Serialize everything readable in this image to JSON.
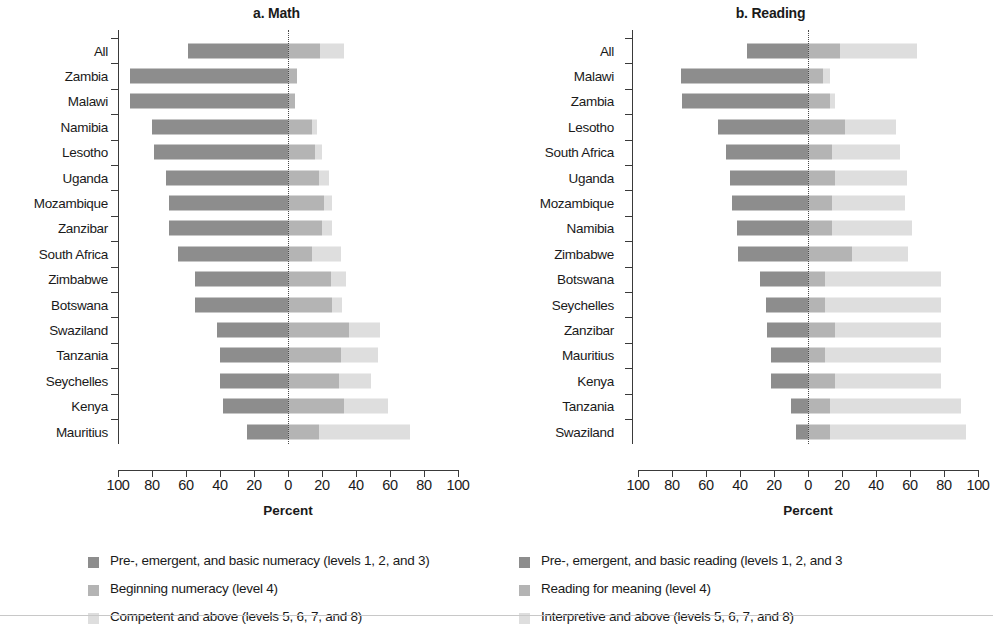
{
  "figure": {
    "background": "#ffffff",
    "colors": {
      "level123": "#8d8d8d",
      "level4": "#b4b4b4",
      "level5678": "#dedede",
      "axis": "#3a3a3a",
      "zeroline": "#4a4a4a"
    },
    "axis_title": "Percent",
    "tick_labels": [
      "100",
      "80",
      "60",
      "40",
      "20",
      "0",
      "20",
      "40",
      "60",
      "80",
      "100"
    ],
    "tick_values": [
      -100,
      -80,
      -60,
      -40,
      -20,
      0,
      20,
      40,
      60,
      80,
      100
    ]
  },
  "panels": [
    {
      "id": "math",
      "title": "a. Math",
      "axis_title": "Percent",
      "legend": [
        {
          "label": "Pre-, emergent, and basic numeracy (levels 1, 2, and 3)",
          "color_key": "level123"
        },
        {
          "label": "Beginning numeracy (level 4)",
          "color_key": "level4"
        },
        {
          "label": "Competent and above (levels 5, 6, 7, and 8)",
          "color_key": "level5678"
        }
      ]
    },
    {
      "id": "reading",
      "title": "b. Reading",
      "axis_title": "Percent",
      "legend": [
        {
          "label": "Pre-, emergent, and basic reading (levels 1, 2, and 3",
          "color_key": "level123"
        },
        {
          "label": "Reading for meaning (level 4)",
          "color_key": "level4"
        },
        {
          "label": "Interpretive and above (levels 5, 6, 7, and 8)",
          "color_key": "level5678"
        }
      ]
    }
  ],
  "chart_data": [
    {
      "type": "bar",
      "orientation": "horizontal",
      "stacked": true,
      "diverging": true,
      "panel": "a. Math",
      "title": "a. Math",
      "xlabel": "Percent",
      "ylabel": "",
      "xlim": [
        -100,
        100
      ],
      "xticks": [
        -100,
        -80,
        -60,
        -40,
        -20,
        0,
        20,
        40,
        60,
        80,
        100
      ],
      "xticklabels": [
        "100",
        "80",
        "60",
        "40",
        "20",
        "0",
        "20",
        "40",
        "60",
        "80",
        "100"
      ],
      "grid": false,
      "legend_position": "below",
      "categories": [
        "All",
        "Zambia",
        "Malawi",
        "Namibia",
        "Lesotho",
        "Uganda",
        "Mozambique",
        "Zanzibar",
        "South Africa",
        "Zimbabwe",
        "Botswana",
        "Swaziland",
        "Tanzania",
        "Seychelles",
        "Kenya",
        "Mauritius"
      ],
      "series": [
        {
          "name": "Pre-, emergent, and basic numeracy (levels 1, 2, and 3)",
          "color": "#8d8d8d",
          "direction": "left",
          "values": [
            59,
            93,
            93,
            80,
            79,
            72,
            70,
            70,
            65,
            55,
            55,
            42,
            40,
            40,
            38,
            24
          ]
        },
        {
          "name": "Beginning numeracy (level 4)",
          "color": "#b4b4b4",
          "direction": "right",
          "values": [
            19,
            5,
            4,
            14,
            16,
            18,
            21,
            20,
            14,
            25,
            26,
            36,
            31,
            30,
            33,
            18
          ]
        },
        {
          "name": "Competent and above (levels 5, 6, 7, and 8)",
          "color": "#dedede",
          "direction": "right",
          "values": [
            14,
            0,
            0,
            3,
            4,
            6,
            5,
            6,
            17,
            9,
            6,
            18,
            22,
            19,
            26,
            54
          ]
        }
      ]
    },
    {
      "type": "bar",
      "orientation": "horizontal",
      "stacked": true,
      "diverging": true,
      "panel": "b. Reading",
      "title": "b. Reading",
      "xlabel": "Percent",
      "ylabel": "",
      "xlim": [
        -100,
        100
      ],
      "xticks": [
        -100,
        -80,
        -60,
        -40,
        -20,
        0,
        20,
        40,
        60,
        80,
        100
      ],
      "xticklabels": [
        "100",
        "80",
        "60",
        "40",
        "20",
        "0",
        "20",
        "40",
        "60",
        "80",
        "100"
      ],
      "grid": false,
      "legend_position": "below",
      "categories": [
        "All",
        "Malawi",
        "Zambia",
        "Lesotho",
        "South Africa",
        "Uganda",
        "Mozambique",
        "Namibia",
        "Zimbabwe",
        "Botswana",
        "Seychelles",
        "Zanzibar",
        "Mauritius",
        "Kenya",
        "Tanzania",
        "Swaziland"
      ],
      "series": [
        {
          "name": "Pre-, emergent, and basic reading (levels 1, 2, and 3",
          "color": "#8d8d8d",
          "direction": "left",
          "values": [
            36,
            75,
            74,
            53,
            48,
            46,
            45,
            42,
            41,
            28,
            25,
            24,
            22,
            22,
            10,
            7
          ]
        },
        {
          "name": "Reading for meaning (level 4)",
          "color": "#b4b4b4",
          "direction": "right",
          "values": [
            19,
            9,
            13,
            22,
            14,
            16,
            14,
            14,
            26,
            10,
            10,
            16,
            10,
            16,
            13,
            13
          ]
        },
        {
          "name": "Interpretive and above (levels 5, 6, 7, and 8)",
          "color": "#dedede",
          "direction": "right",
          "values": [
            45,
            4,
            3,
            30,
            40,
            42,
            43,
            47,
            33,
            68,
            68,
            62,
            68,
            62,
            77,
            80
          ]
        }
      ]
    }
  ]
}
